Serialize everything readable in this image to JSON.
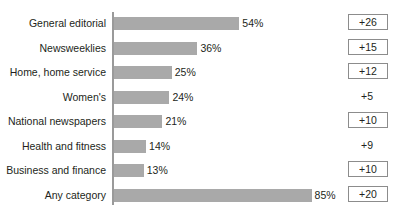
{
  "chart_data": {
    "type": "bar",
    "orientation": "horizontal",
    "title": "",
    "subtitle": "",
    "xlabel": "",
    "ylabel": "",
    "grid": false,
    "legend": null,
    "xlim": [
      0,
      100
    ],
    "categories": [
      "General editorial",
      "Newsweeklies",
      "Home, home service",
      "Women's",
      "National newspapers",
      "Health and fitness",
      "Business and finance",
      "Any category"
    ],
    "values": [
      54,
      36,
      25,
      24,
      21,
      14,
      13,
      85
    ],
    "value_labels": [
      "54%",
      "36%",
      "25%",
      "24%",
      "21%",
      "14%",
      "13%",
      "85%"
    ],
    "change_labels": [
      "+26",
      "+15",
      "+12",
      "+5",
      "+10",
      "+9",
      "+10",
      "+20"
    ],
    "change_values": [
      26,
      15,
      12,
      5,
      10,
      9,
      10,
      20
    ],
    "change_boxed": [
      true,
      true,
      true,
      false,
      true,
      false,
      true,
      true
    ],
    "bar_color": "#a9a9a9",
    "axis_color": "#9a9a9a",
    "text_color": "#231f20",
    "box_border_color": "#8c8c8c",
    "rows": [
      {
        "category": "General editorial",
        "value": 54,
        "value_label": "54%",
        "change_label": "+26",
        "boxed": true
      },
      {
        "category": "Newsweeklies",
        "value": 36,
        "value_label": "36%",
        "change_label": "+15",
        "boxed": true
      },
      {
        "category": "Home, home service",
        "value": 25,
        "value_label": "25%",
        "change_label": "+12",
        "boxed": true
      },
      {
        "category": "Women's",
        "value": 24,
        "value_label": "24%",
        "change_label": "+5",
        "boxed": false
      },
      {
        "category": "National newspapers",
        "value": 21,
        "value_label": "21%",
        "change_label": "+10",
        "boxed": true
      },
      {
        "category": "Health and fitness",
        "value": 14,
        "value_label": "14%",
        "change_label": "+9",
        "boxed": false
      },
      {
        "category": "Business and finance",
        "value": 13,
        "value_label": "13%",
        "change_label": "+10",
        "boxed": true
      },
      {
        "category": "Any category",
        "value": 85,
        "value_label": "85%",
        "change_label": "+20",
        "boxed": true
      }
    ]
  },
  "layout": {
    "px_per_percent": 2.33,
    "row_pitch": 24.5,
    "first_row_top": 15,
    "bar_height": 13
  }
}
